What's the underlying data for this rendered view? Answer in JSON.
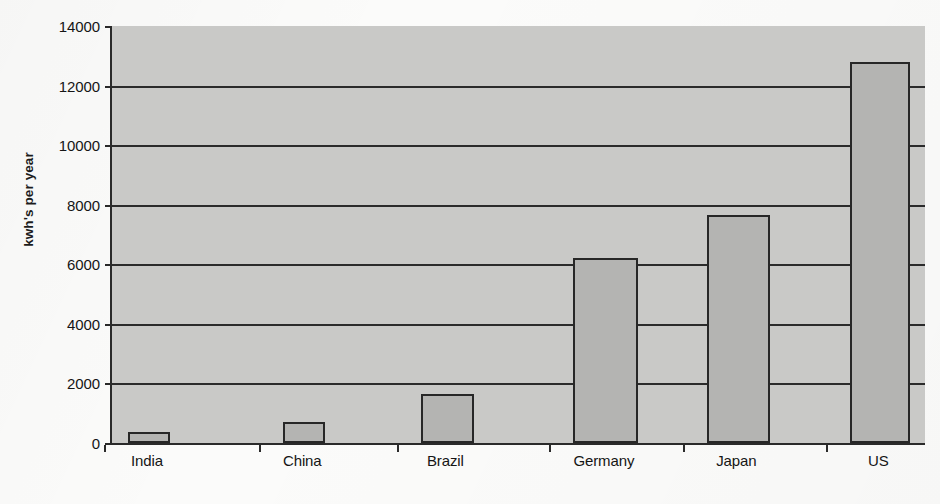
{
  "chart_data": {
    "type": "bar",
    "title": "",
    "subtitle": "",
    "xlabel": "",
    "ylabel": "kwh's per year",
    "categories": [
      "India",
      "China",
      "Brazil",
      "Germany",
      "Japan",
      "US"
    ],
    "values": [
      370,
      700,
      1640,
      6200,
      7670,
      12800
    ],
    "ylim": [
      0,
      14000
    ],
    "y_ticks": [
      0,
      2000,
      4000,
      6000,
      8000,
      10000,
      12000,
      14000
    ],
    "y_tick_labels": [
      "0",
      "2000",
      "4000",
      "6000",
      "8000",
      "10000",
      "12000",
      "14000"
    ],
    "grid": true,
    "grid_axis": "y",
    "legend": false,
    "legend_position": "none",
    "series": [
      {
        "name": "Electricity consumption per capita",
        "values": [
          370,
          700,
          1640,
          6200,
          7670,
          12800
        ]
      }
    ],
    "bar_color": "#b4b4b2",
    "bar_edge_color": "#272727",
    "plot_background_color": "#c9c9c7",
    "axis_color": "#2a2a2a",
    "figure_background_color": "#fbfbfa",
    "bar_centers_fraction": [
      0.0455,
      0.2365,
      0.4125,
      0.6075,
      0.7705,
      0.945
    ],
    "bar_width_fraction": [
      0.052,
      0.052,
      0.066,
      0.08,
      0.077,
      0.074
    ]
  }
}
